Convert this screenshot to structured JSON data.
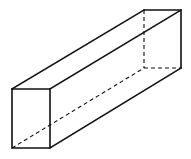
{
  "diagram": {
    "stroke_color": "#111111",
    "background": "#ffffff",
    "front_face": [
      [
        12,
        89
      ],
      [
        50,
        89
      ],
      [
        50,
        148
      ],
      [
        12,
        148
      ]
    ],
    "back_face": [
      [
        144,
        10
      ],
      [
        181,
        10
      ],
      [
        181,
        68
      ],
      [
        144,
        68
      ]
    ],
    "visible_edges": [
      [
        [
          12,
          89
        ],
        [
          144,
          10
        ]
      ],
      [
        [
          50,
          89
        ],
        [
          181,
          10
        ]
      ],
      [
        [
          50,
          148
        ],
        [
          181,
          68
        ]
      ]
    ],
    "hidden_edges": [
      [
        [
          12,
          148
        ],
        [
          144,
          68
        ]
      ],
      [
        [
          144,
          10
        ],
        [
          144,
          68
        ]
      ],
      [
        [
          144,
          68
        ],
        [
          181,
          68
        ]
      ]
    ]
  }
}
